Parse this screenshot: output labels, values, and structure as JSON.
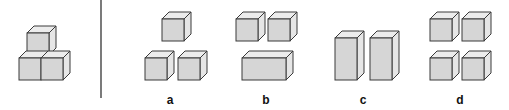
{
  "figure": {
    "reference_shape": {
      "name": "stacked-cubes",
      "pieces": "3 unit cubes: 2 on bottom row, 1 on top-left"
    },
    "options": [
      {
        "id": "a",
        "label": "a",
        "pieces": "3 single cubes"
      },
      {
        "id": "b",
        "label": "b",
        "pieces": "2 single cubes and 1 wide 2x1 block"
      },
      {
        "id": "c",
        "label": "c",
        "pieces": "2 tall 1x2 blocks"
      },
      {
        "id": "d",
        "label": "d",
        "pieces": "4 single cubes"
      }
    ]
  }
}
